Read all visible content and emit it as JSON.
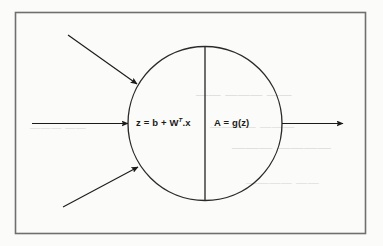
{
  "figure": {
    "border": {
      "label": "figure-border",
      "color": "#6f6f6f"
    },
    "neuron": {
      "label": "neuron-body",
      "shape": "circle",
      "center_x": 205,
      "center_y": 123.5,
      "radius": 77,
      "stroke_color": "#2a2a2a",
      "divider": {
        "label": "neuron-divider",
        "x": 205,
        "y_top": 47,
        "y_bottom": 200
      },
      "left_compartment": {
        "name": "linear-combination",
        "text_prefix": "z = b + W",
        "text_superscript": "T",
        "text_suffix": ".x"
      },
      "right_compartment": {
        "name": "activation-function",
        "text": "A = g(z)"
      }
    },
    "arrows": [
      {
        "name": "input-arrow-top",
        "direction": "diagonal-down-right",
        "x1": 68,
        "y1": 35,
        "x2": 137,
        "y2": 84
      },
      {
        "name": "input-arrow-middle",
        "direction": "horizontal-right",
        "x1": 32,
        "y1": 123.5,
        "x2": 128,
        "y2": 123.5
      },
      {
        "name": "input-arrow-bottom",
        "direction": "diagonal-up-right",
        "x1": 63,
        "y1": 207,
        "x2": 138,
        "y2": 167
      },
      {
        "name": "output-arrow",
        "direction": "horizontal-right",
        "x1": 282,
        "y1": 123.5,
        "x2": 343,
        "y2": 123.5
      }
    ],
    "colors": {
      "page_background": "#fbfbfa",
      "ink": "#1b1b1b",
      "border_gray": "#6f6f6f",
      "ghost_gray": "#e2e0df"
    }
  },
  "ghost_text": {
    "line1": "—— ——— ——",
    "line2": "———— ———",
    "line3": "——— ————",
    "line4": "———— ——",
    "line5": "——— ——"
  }
}
